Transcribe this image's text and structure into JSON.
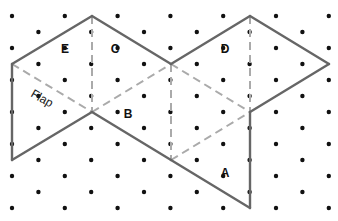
{
  "diagram": {
    "type": "isometric dot-grid net",
    "colors": {
      "background": "#ffffff",
      "dot": "#111111",
      "solid_line": "#666666",
      "dashed_line": "#aaaaaa",
      "label": "#111111"
    },
    "grid": {
      "x0": 12,
      "dx": 26.4,
      "cols": 13,
      "y0": 16,
      "dy": 16,
      "rows": 13
    },
    "vertices": {
      "P1": [
        12,
        64
      ],
      "P2": [
        92,
        16
      ],
      "P3": [
        171,
        64
      ],
      "P4": [
        250,
        16
      ],
      "P5": [
        329,
        64
      ],
      "P6": [
        250,
        112
      ],
      "P7": [
        92,
        112
      ],
      "P8": [
        12,
        160
      ],
      "P9": [
        171,
        160
      ],
      "P10": [
        250,
        208
      ]
    },
    "solid_edges": [
      [
        "P1",
        "P2"
      ],
      [
        "P2",
        "P3"
      ],
      [
        "P3",
        "P4"
      ],
      [
        "P4",
        "P5"
      ],
      [
        "P5",
        "P6"
      ],
      [
        "P6",
        "P10"
      ],
      [
        "P10",
        "P9"
      ],
      [
        "P9",
        "P7"
      ],
      [
        "P7",
        "P8"
      ],
      [
        "P8",
        "P1"
      ]
    ],
    "dashed_edges": [
      [
        "P2",
        "P7"
      ],
      [
        "P1",
        "P7"
      ],
      [
        "P7",
        "P3"
      ],
      [
        "P3",
        "P6"
      ],
      [
        "P4",
        "P6"
      ],
      [
        "P3",
        "P9"
      ],
      [
        "P9",
        "P6"
      ]
    ],
    "labels": [
      {
        "id": "E",
        "text": "E",
        "x": 65,
        "y": 53
      },
      {
        "id": "C",
        "text": "C",
        "x": 115,
        "y": 53
      },
      {
        "id": "D",
        "text": "D",
        "x": 225,
        "y": 53
      },
      {
        "id": "B",
        "text": "B",
        "x": 128,
        "y": 118
      },
      {
        "id": "A",
        "text": "A",
        "x": 225,
        "y": 177
      }
    ],
    "flap_label": {
      "text": "Flap",
      "x": 30,
      "y": 96,
      "rotate": 30
    }
  }
}
